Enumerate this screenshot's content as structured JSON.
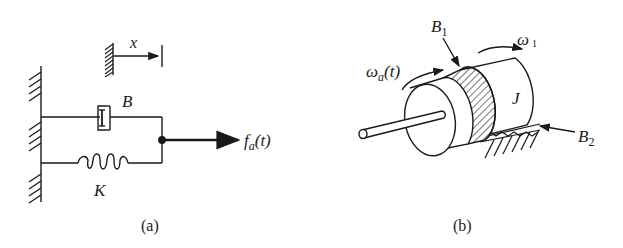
{
  "figure_a": {
    "caption": "(a)",
    "displacement_label": "x",
    "damper_label": "B",
    "spring_label": "K",
    "force_label_main": "f",
    "force_label_sub": "a",
    "force_label_arg": "(t)"
  },
  "figure_b": {
    "caption": "(b)",
    "input_speed_main": "ω",
    "input_speed_sub": "a",
    "input_speed_arg": "(t)",
    "output_speed_main": "ω",
    "output_speed_sub": "1",
    "friction1_main": "B",
    "friction1_sub": "1",
    "friction2_main": "B",
    "friction2_sub": "2",
    "inertia_label": "J"
  },
  "colors": {
    "ink": "#1a1a1a",
    "background": "#ffffff"
  }
}
